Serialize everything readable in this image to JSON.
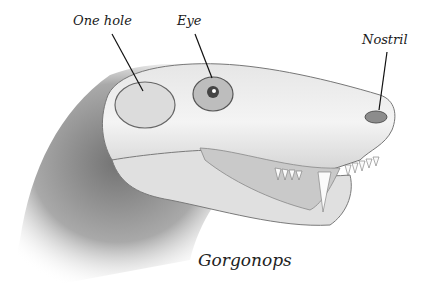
{
  "figure": {
    "subject": "Gorgonops",
    "caption": "Gorgonops",
    "labels": [
      {
        "id": "one-hole",
        "text": "One hole"
      },
      {
        "id": "eye",
        "text": "Eye"
      },
      {
        "id": "nostril",
        "text": "Nostril"
      }
    ],
    "colors": {
      "background": "#ffffff",
      "ink": "#1a1a1a",
      "skull_light": "#f2f2f2",
      "shadow": "#6e6e6e"
    }
  }
}
